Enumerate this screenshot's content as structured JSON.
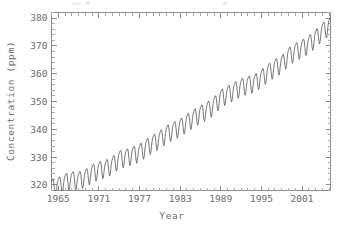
{
  "chart_data": {
    "type": "line",
    "title": "",
    "xlabel": "Year",
    "ylabel": "Concentration (ppm)",
    "xlim": [
      1964.0,
      2005.2
    ],
    "ylim": [
      318.0,
      382.0
    ],
    "grid": false,
    "legend": null,
    "x_ticks": [
      1965,
      1971,
      1977,
      1983,
      1989,
      1995,
      2001
    ],
    "x_tick_labels": [
      "1965",
      "1971",
      "1977",
      "1983",
      "1989",
      "1995",
      "2001"
    ],
    "x_minor_step": 1,
    "y_ticks": [
      320,
      330,
      340,
      350,
      360,
      370,
      380
    ],
    "y_tick_labels": [
      "320",
      "330",
      "340",
      "350",
      "360",
      "370",
      "380"
    ],
    "y_minor_step": 2,
    "series": [
      {
        "name": "Atmospheric CO2",
        "color": "#555555",
        "description": "Monthly mean CO2 concentration with rising trend and annual seasonal cycle",
        "trend_start_ppm": 319.8,
        "trend_end_ppm": 377.5,
        "seasonal_amplitude_ppm": 3.1,
        "seasonal_peak_month": 5,
        "x": [
          1964.5,
          1965.0,
          1965.5,
          1966.0,
          1966.5,
          1967.0,
          1967.5,
          1968.0,
          1968.5,
          1969.0,
          1969.5,
          1970.0,
          1970.5,
          1971.0,
          1971.5,
          1972.0,
          1972.5,
          1973.0,
          1973.5,
          1974.0,
          1974.5,
          1975.0,
          1975.5,
          1976.0,
          1976.5,
          1977.0,
          1977.5,
          1978.0,
          1978.5,
          1979.0,
          1979.5,
          1980.0,
          1980.5,
          1981.0,
          1981.5,
          1982.0,
          1982.5,
          1983.0,
          1983.5,
          1984.0,
          1984.5,
          1985.0,
          1985.5,
          1986.0,
          1986.5,
          1987.0,
          1987.5,
          1988.0,
          1988.5,
          1989.0,
          1989.5,
          1990.0,
          1990.5,
          1991.0,
          1991.5,
          1992.0,
          1992.5,
          1993.0,
          1993.5,
          1994.0,
          1994.5,
          1995.0,
          1995.5,
          1996.0,
          1996.5,
          1997.0,
          1997.5,
          1998.0,
          1998.5,
          1999.0,
          1999.5,
          2000.0,
          2000.5,
          2001.0,
          2001.5,
          2002.0,
          2002.5,
          2003.0,
          2003.5,
          2004.0,
          2004.5,
          2005.0
        ],
        "yearly_annual_mean": [
          319.4,
          320.0,
          321.4,
          322.2,
          322.0,
          322.9,
          324.6,
          325.7,
          326.3,
          327.5,
          329.7,
          330.2,
          331.1,
          332.0,
          333.8,
          335.4,
          336.8,
          338.7,
          339.9,
          341.1,
          342.8,
          344.4,
          345.9,
          347.2,
          348.9,
          351.6,
          352.9,
          354.2,
          355.6,
          356.4,
          357.1,
          358.8,
          360.8,
          362.6,
          363.8,
          366.6,
          368.3,
          369.5,
          371.0,
          373.1,
          375.6,
          377.4
        ]
      }
    ]
  },
  "figure": {
    "background_color": "#ffffff",
    "frame_color": "#8c8c8c",
    "text_color": "#6b6b6b",
    "line_color": "#555555"
  }
}
